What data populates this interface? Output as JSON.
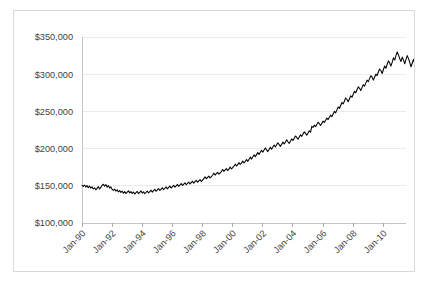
{
  "chart_data": {
    "type": "line",
    "title": "",
    "subtitle": "",
    "xlabel": "",
    "ylabel": "",
    "grid": true,
    "legend": false,
    "legend_position": "none",
    "line_color": "#000000",
    "gridline_color": "#E6E6E6",
    "axis_color": "#BFBFBF",
    "text_color": "#3F3F3F",
    "ylim": [
      100000,
      350000
    ],
    "ytick_labels": [
      "$350,000",
      "$300,000",
      "$250,000",
      "$200,000",
      "$150,000",
      "$100,000"
    ],
    "ytick_values": [
      350000,
      300000,
      250000,
      200000,
      150000,
      100000
    ],
    "xtick_labels": [
      "Jan-90",
      "Jan-92",
      "Jan-94",
      "Jan-96",
      "Jan-98",
      "Jan-00",
      "Jan-02",
      "Jan-04",
      "Jan-06",
      "Jan-08",
      "Jan-10"
    ],
    "xtick_values": [
      1990.0,
      1992.0,
      1994.0,
      1996.0,
      1998.0,
      2000.0,
      2002.0,
      2004.0,
      2006.0,
      2008.0,
      2010.0
    ],
    "xtick_rotation_deg": 45,
    "xlim": [
      1990.0,
      2011.5
    ],
    "x_start": 1990.0,
    "x_step_years": 0.08333,
    "series": [
      {
        "name": "Home Price Index",
        "values": [
          150500,
          149200,
          151000,
          148300,
          150200,
          147500,
          149800,
          146900,
          148600,
          145800,
          147200,
          144600,
          146500,
          148900,
          145700,
          147800,
          150600,
          152100,
          149400,
          151800,
          148200,
          150300,
          146900,
          148500,
          145200,
          143800,
          145600,
          142900,
          144700,
          141800,
          143500,
          141200,
          142800,
          140100,
          142200,
          139600,
          141400,
          143200,
          140500,
          142100,
          139800,
          141600,
          138900,
          140700,
          142400,
          139500,
          141300,
          143100,
          140200,
          142000,
          139300,
          141100,
          143000,
          140400,
          142300,
          144100,
          141500,
          143400,
          145200,
          142600,
          144500,
          146300,
          143700,
          145600,
          147400,
          144800,
          146700,
          148500,
          145900,
          147800,
          149600,
          147000,
          148900,
          150700,
          148100,
          150000,
          151800,
          149200,
          151100,
          152900,
          150300,
          152200,
          154000,
          151400,
          153300,
          155100,
          152500,
          154400,
          156200,
          153600,
          155500,
          157300,
          154700,
          156600,
          158400,
          155800,
          157700,
          159500,
          162000,
          159400,
          161300,
          163100,
          160500,
          162400,
          164200,
          167000,
          164400,
          166300,
          168100,
          165500,
          167400,
          169200,
          172000,
          169400,
          171300,
          173100,
          170500,
          172400,
          175200,
          172600,
          174500,
          176300,
          179100,
          176500,
          178400,
          181200,
          178600,
          180500,
          183300,
          180700,
          182600,
          185400,
          182800,
          185700,
          188500,
          185900,
          188800,
          191600,
          189000,
          191900,
          194700,
          192100,
          195000,
          197800,
          195200,
          198100,
          200900,
          198300,
          196000,
          198900,
          201700,
          199100,
          202000,
          204800,
          202200,
          205100,
          207900,
          205300,
          203000,
          205900,
          208700,
          206100,
          209000,
          211800,
          209200,
          207000,
          210000,
          213000,
          211000,
          214000,
          217000,
          215000,
          212500,
          215500,
          218500,
          216500,
          219500,
          222500,
          220500,
          218000,
          221000,
          224000,
          222000,
          230000,
          228500,
          231500,
          229500,
          232500,
          235500,
          233500,
          231000,
          234000,
          237000,
          235000,
          238000,
          241000,
          239000,
          242000,
          245000,
          243000,
          246500,
          250000,
          248000,
          252000,
          256000,
          254000,
          258000,
          262000,
          260000,
          264000,
          268000,
          266000,
          263000,
          267000,
          271000,
          269000,
          273000,
          277000,
          275000,
          279000,
          283000,
          281000,
          278000,
          282000,
          286000,
          284000,
          288000,
          292000,
          290000,
          294000,
          298000,
          296000,
          292000,
          296000,
          300000,
          298000,
          303000,
          307000,
          305000,
          301000,
          306000,
          311000,
          308000,
          313000,
          318000,
          315000,
          311000,
          316000,
          322000,
          319000,
          325000,
          330000,
          326000,
          321000,
          317000,
          323000,
          319000,
          314000,
          320000,
          325000,
          321000,
          316000,
          310000,
          315000,
          320000,
          314000,
          308000,
          302000,
          296000,
          290000,
          296000,
          291000,
          285000,
          278000,
          271000,
          265000,
          258000,
          251000,
          245000,
          252000,
          259000,
          265000,
          261000,
          255000,
          262000,
          268000,
          264000,
          258000,
          252000,
          259000,
          265000,
          261000,
          256000,
          250000,
          256000,
          262000,
          258000,
          253000,
          257000,
          255000
        ]
      }
    ]
  }
}
